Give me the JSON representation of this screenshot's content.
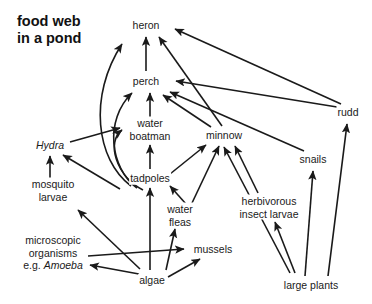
{
  "title": {
    "line1": "food web",
    "line2": "in a pond",
    "text": "food web\nin a pond"
  },
  "diagram": {
    "type": "food-web",
    "width": 372,
    "height": 304,
    "background_color": "#ffffff",
    "line_color": "#1a1a1a",
    "text_color": "#1a1a1a",
    "arrow_meaning": "arrow points from food source to consumer (energy flow)"
  },
  "nodes": [
    {
      "id": "heron",
      "label": "heron",
      "x": 146,
      "y": 25,
      "italic": false,
      "trophic": "top predator"
    },
    {
      "id": "perch",
      "label": "perch",
      "x": 146,
      "y": 81,
      "italic": false,
      "trophic": "predatory fish"
    },
    {
      "id": "rudd",
      "label": "rudd",
      "x": 348,
      "y": 112,
      "italic": false,
      "trophic": "fish"
    },
    {
      "id": "water_boatman",
      "label": "water\nboatman",
      "line1": "water",
      "line2": "boatman",
      "x": 150,
      "y": 129,
      "italic": false,
      "trophic": "insect"
    },
    {
      "id": "minnow",
      "label": "minnow",
      "x": 224,
      "y": 135,
      "italic": false,
      "trophic": "fish"
    },
    {
      "id": "hydra",
      "label": "Hydra",
      "x": 50,
      "y": 145,
      "italic": true,
      "trophic": "invertebrate predator"
    },
    {
      "id": "snails",
      "label": "snails",
      "x": 313,
      "y": 159,
      "italic": false,
      "trophic": "herbivore"
    },
    {
      "id": "tadpoles",
      "label": "tadpoles",
      "x": 150,
      "y": 178,
      "italic": false,
      "trophic": "herbivore"
    },
    {
      "id": "mosquito_larvae",
      "label": "mosquito\nlarvae",
      "line1": "mosquito",
      "line2": "larvae",
      "x": 53,
      "y": 190,
      "italic": false,
      "trophic": "detritivore"
    },
    {
      "id": "herbivorous_insect_larvae",
      "label": "herbivorous\ninsect larvae",
      "line1": "herbivorous",
      "line2": "insect larvae",
      "x": 269,
      "y": 207,
      "italic": false,
      "trophic": "herbivore"
    },
    {
      "id": "water_fleas",
      "label": "water\nfleas",
      "line1": "water",
      "line2": "fleas",
      "x": 180,
      "y": 215,
      "italic": false,
      "trophic": "zooplankton"
    },
    {
      "id": "mussels",
      "label": "mussels",
      "x": 213,
      "y": 249,
      "italic": false,
      "trophic": "filter feeder"
    },
    {
      "id": "microscopic_organisms",
      "label": "microscopic\norganisms\ne.g. Amoeba",
      "line1": "microscopic",
      "line2": "organisms",
      "line3_plain": "e.g. ",
      "line3_italic": "Amoeba",
      "x": 53,
      "y": 253,
      "italic": false,
      "trophic": "protozoa"
    },
    {
      "id": "algae",
      "label": "algae",
      "x": 152,
      "y": 280,
      "italic": false,
      "trophic": "producer"
    },
    {
      "id": "large_plants",
      "label": "large plants",
      "x": 311,
      "y": 285,
      "italic": false,
      "trophic": "producer"
    }
  ],
  "edges": [
    {
      "from": "perch",
      "to": "heron",
      "shape": "straight"
    },
    {
      "from": "tadpoles",
      "to": "heron",
      "shape": "curve"
    },
    {
      "from": "rudd",
      "to": "heron",
      "shape": "straight"
    },
    {
      "from": "minnow",
      "to": "heron",
      "shape": "straight"
    },
    {
      "from": "water_boatman",
      "to": "perch",
      "shape": "straight"
    },
    {
      "from": "tadpoles",
      "to": "perch",
      "shape": "curve"
    },
    {
      "from": "minnow",
      "to": "perch",
      "shape": "straight"
    },
    {
      "from": "snails",
      "to": "perch",
      "shape": "straight"
    },
    {
      "from": "rudd",
      "to": "perch",
      "shape": "straight"
    },
    {
      "from": "hydra",
      "to": "water_boatman",
      "shape": "straight"
    },
    {
      "from": "tadpoles",
      "to": "water_boatman",
      "shape": "curve"
    },
    {
      "from": "tadpoles",
      "to": "water_boatman",
      "shape": "straight"
    },
    {
      "from": "tadpoles",
      "to": "minnow",
      "shape": "straight"
    },
    {
      "from": "water_fleas",
      "to": "minnow",
      "shape": "straight"
    },
    {
      "from": "herbivorous_insect_larvae",
      "to": "minnow",
      "shape": "straight"
    },
    {
      "from": "mussels",
      "to": "minnow",
      "shape": "straight"
    },
    {
      "from": "mosquito_larvae",
      "to": "hydra",
      "shape": "straight"
    },
    {
      "from": "water_fleas",
      "to": "hydra",
      "shape": "straight"
    },
    {
      "from": "water_fleas",
      "to": "tadpoles",
      "shape": "straight"
    },
    {
      "from": "algae",
      "to": "tadpoles",
      "shape": "straight"
    },
    {
      "from": "algae",
      "to": "water_fleas",
      "shape": "straight"
    },
    {
      "from": "algae",
      "to": "mussels",
      "shape": "straight"
    },
    {
      "from": "algae",
      "to": "microscopic_organisms",
      "shape": "straight"
    },
    {
      "from": "algae",
      "to": "mosquito_larvae",
      "shape": "straight"
    },
    {
      "from": "microscopic_organisms",
      "to": "mussels",
      "shape": "straight"
    },
    {
      "from": "large_plants",
      "to": "snails",
      "shape": "straight"
    },
    {
      "from": "large_plants",
      "to": "rudd",
      "shape": "straight"
    },
    {
      "from": "large_plants",
      "to": "herbivorous_insect_larvae",
      "shape": "straight"
    }
  ]
}
